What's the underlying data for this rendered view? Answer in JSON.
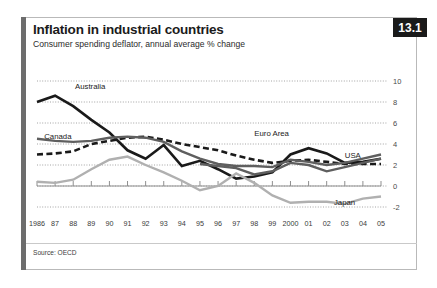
{
  "badge": {
    "number": "13.1"
  },
  "header": {
    "title": "Inflation in industrial countries",
    "subtitle": "Consumer spending deflator, annual average % change"
  },
  "footer": {
    "source": "Source: OECD"
  },
  "chart_data": {
    "type": "line",
    "title": "Inflation in industrial countries",
    "subtitle": "Consumer spending deflator, annual average % change",
    "xlabel": "",
    "ylabel": "",
    "ylim": [
      -3,
      10
    ],
    "xlim": [
      "1986",
      "2005"
    ],
    "yticks": [
      10,
      8,
      6,
      4,
      2,
      0,
      -2
    ],
    "ytick_labels": [
      "10",
      "8",
      "6",
      "4",
      "2",
      "0",
      "-2"
    ],
    "grid": true,
    "grid_style": "dotted-horizontal",
    "zero_axis": true,
    "legend": "inline-labels",
    "categories": [
      "1986",
      "87",
      "88",
      "89",
      "90",
      "91",
      "92",
      "93",
      "94",
      "95",
      "96",
      "97",
      "98",
      "99",
      "2000",
      "01",
      "02",
      "03",
      "04",
      "05"
    ],
    "x": [
      1986,
      1987,
      1988,
      1989,
      1990,
      1991,
      1992,
      1993,
      1994,
      1995,
      1996,
      1997,
      1998,
      1999,
      2000,
      2001,
      2002,
      2003,
      2004,
      2005
    ],
    "series": [
      {
        "name": "Australia",
        "style": "solid",
        "color": "#1a1a1a",
        "width": 2.6,
        "label_x": 1988.1,
        "label_y": 9.4,
        "values": [
          8.0,
          8.6,
          7.6,
          6.3,
          5.1,
          3.4,
          2.6,
          3.9,
          1.9,
          2.4,
          1.6,
          0.7,
          0.9,
          1.3,
          3.0,
          3.6,
          3.1,
          2.2,
          2.3,
          2.6
        ]
      },
      {
        "name": "Euro Area",
        "style": "dashed",
        "color": "#1a1a1a",
        "width": 2.6,
        "label_x": 1998.0,
        "label_y": 5.0,
        "values": [
          3.0,
          3.1,
          3.3,
          4.0,
          4.3,
          4.6,
          4.7,
          4.4,
          4.0,
          3.7,
          3.4,
          2.9,
          2.5,
          2.2,
          2.4,
          2.5,
          2.3,
          2.1,
          2.1,
          2.1
        ]
      },
      {
        "name": "Canada",
        "style": "solid",
        "color": "#5f5f5f",
        "width": 2.4,
        "label_x": 1986.4,
        "label_y": 4.7,
        "values": [
          4.5,
          4.3,
          4.2,
          4.3,
          4.6,
          4.7,
          4.6,
          4.2,
          3.3,
          2.6,
          2.1,
          1.9,
          1.9,
          1.8,
          2.5,
          2.3,
          2.0,
          2.2,
          2.6,
          3.0
        ]
      },
      {
        "name": "Japan",
        "style": "solid",
        "color": "#b0b0b0",
        "width": 2.4,
        "label_x": 2002.4,
        "label_y": -1.6,
        "values": [
          0.4,
          0.3,
          0.6,
          1.6,
          2.5,
          2.8,
          2.0,
          1.3,
          0.5,
          -0.4,
          0.0,
          1.2,
          0.3,
          -0.9,
          -1.6,
          -1.5,
          -1.5,
          -1.7,
          -1.2,
          -1.0
        ]
      },
      {
        "name": "USA",
        "style": "solid",
        "color": "#5f5f5f",
        "width": 2.4,
        "label_x": 2003.0,
        "label_y": 2.9,
        "values": [
          null,
          null,
          null,
          null,
          null,
          null,
          null,
          null,
          null,
          2.1,
          1.9,
          1.7,
          1.1,
          1.4,
          2.2,
          2.0,
          1.4,
          1.8,
          2.2,
          2.6
        ]
      }
    ]
  }
}
